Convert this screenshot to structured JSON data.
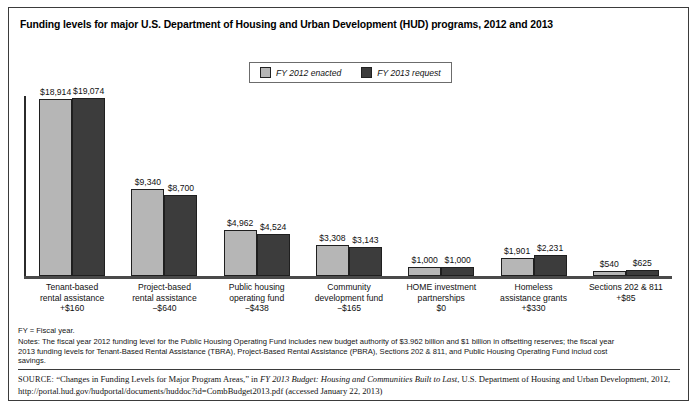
{
  "figure": {
    "title": "Funding levels for major U.S. Department of Housing and Urban Development (HUD) programs, 2012 and 2013"
  },
  "legend": {
    "items": [
      {
        "label": "FY 2012 enacted",
        "color": "#b6b6b6"
      },
      {
        "label": "FY 2013 request",
        "color": "#3c3c3c"
      }
    ]
  },
  "notes": {
    "fy": "FY = Fiscal year.",
    "line1": "Notes: The fiscal year 2012 funding level for the Public Housing Operating Fund includes new budget authority of $3.962 billion and $1 billion in offsetting reserves; the fiscal year",
    "line2": "2013 funding levels for Tenant-Based Rental Assistance (TBRA), Project-Based Rental Assistance (PBRA), Sections 202 & 811, and Public Housing Operating Fund includ cost",
    "line3": "savings."
  },
  "source": {
    "label": "SOURCE:",
    "text_before": " “Changes in Funding Levels for Major Program Areas,” in ",
    "italic_title": "FY 2013 Budget: Housing and Communities Built to Last",
    "text_after": ", U.S. Department of Housing and Urban Development, 2012, http://portal.hud.gov/hudportal/documents/huddoc?id=CombBudget2013.pdf (accessed January 22, 2013)"
  },
  "chart_data": {
    "type": "bar",
    "title": "Funding levels for major U.S. Department of Housing and Urban Development (HUD) programs, 2012 and 2013",
    "xlabel": "",
    "ylabel": "",
    "ylim": [
      0,
      19074
    ],
    "grid": false,
    "legend_position": "top-center",
    "value_unit": "millions of dollars",
    "categories": [
      "Tenant-based rental assistance",
      "Project-based rental assistance",
      "Public housing operating fund",
      "Community development fund",
      "HOME investment partnerships",
      "Homeless assistance grants",
      "Sections 202 & 811"
    ],
    "category_lines": [
      [
        "Tenant-based",
        "rental assistance",
        "+$160"
      ],
      [
        "Project-based",
        "rental assistance",
        "−$640"
      ],
      [
        "Public housing",
        "operating fund",
        "−$438"
      ],
      [
        "Community",
        "development fund",
        "−$165"
      ],
      [
        "HOME investment",
        "partnerships",
        "$0"
      ],
      [
        "Homeless",
        "assistance grants",
        "+$330"
      ],
      [
        "Sections 202 & 811",
        "+$85",
        ""
      ]
    ],
    "change_values": [
      "+$160",
      "−$640",
      "−$438",
      "−$165",
      "$0",
      "+$330",
      "+$85"
    ],
    "series": [
      {
        "name": "FY 2012 enacted",
        "color": "#b6b6b6",
        "values": [
          18914,
          9340,
          4962,
          3308,
          1000,
          1901,
          540
        ],
        "labels": [
          "$18,914",
          "$9,340",
          "$4,962",
          "$3,308",
          "$1,000",
          "$1,901",
          "$540"
        ]
      },
      {
        "name": "FY 2013 request",
        "color": "#3c3c3c",
        "values": [
          19074,
          8700,
          4524,
          3143,
          1000,
          2231,
          625
        ],
        "labels": [
          "$19,074",
          "$8,700",
          "$4,524",
          "$3,143",
          "$1,000",
          "$2,231",
          "$625"
        ]
      }
    ]
  }
}
